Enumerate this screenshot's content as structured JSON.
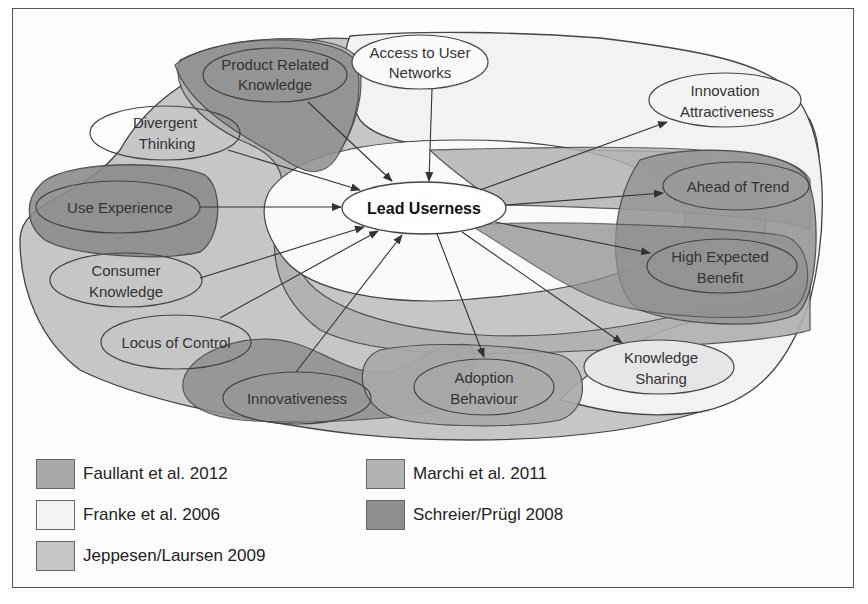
{
  "diagram": {
    "center": {
      "label": "Lead Userness"
    },
    "nodes": [
      {
        "id": "product-related-knowledge",
        "lines": [
          "Product Related",
          "Knowledge"
        ]
      },
      {
        "id": "access-to-user-networks",
        "lines": [
          "Access to User",
          "Networks"
        ]
      },
      {
        "id": "innovation-attractiveness",
        "lines": [
          "Innovation",
          "Attractiveness"
        ]
      },
      {
        "id": "divergent-thinking",
        "lines": [
          "Divergent",
          "Thinking"
        ]
      },
      {
        "id": "use-experience",
        "lines": [
          "Use Experience"
        ]
      },
      {
        "id": "ahead-of-trend",
        "lines": [
          "Ahead of Trend"
        ]
      },
      {
        "id": "consumer-knowledge",
        "lines": [
          "Consumer",
          "Knowledge"
        ]
      },
      {
        "id": "high-expected-benefit",
        "lines": [
          "High Expected",
          "Benefit"
        ]
      },
      {
        "id": "locus-of-control",
        "lines": [
          "Locus of Control"
        ]
      },
      {
        "id": "knowledge-sharing",
        "lines": [
          "Knowledge",
          "Sharing"
        ]
      },
      {
        "id": "innovativeness",
        "lines": [
          "Innovativeness"
        ]
      },
      {
        "id": "adoption-behaviour",
        "lines": [
          "Adoption",
          "Behaviour"
        ]
      }
    ],
    "antecedents": [
      "Product Related Knowledge",
      "Access to User Networks",
      "Divergent Thinking",
      "Use Experience",
      "Consumer Knowledge",
      "Locus of Control",
      "Innovativeness"
    ],
    "consequences": [
      "Innovation Attractiveness",
      "Ahead of Trend",
      "High Expected Benefit",
      "Knowledge Sharing",
      "Adoption Behaviour"
    ]
  },
  "legend": {
    "items": [
      {
        "label": "Faullant et al. 2012",
        "color": "#a9a9a9"
      },
      {
        "label": "Franke et al. 2006",
        "color": "#f4f4f4"
      },
      {
        "label": "Jeppesen/Laursen 2009",
        "color": "#c6c6c6"
      },
      {
        "label": "Marchi et al. 2011",
        "color": "#b3b3b3"
      },
      {
        "label": "Schreier/Prügl 2008",
        "color": "#8f8f8f"
      }
    ]
  },
  "colors": {
    "faullant": "#a9a9a9",
    "franke": "#f4f4f4",
    "jeppesen": "#c6c6c6",
    "marchi": "#b3b3b3",
    "schreier": "#8f8f8f",
    "stroke": "#444444",
    "frame": "#555555"
  }
}
